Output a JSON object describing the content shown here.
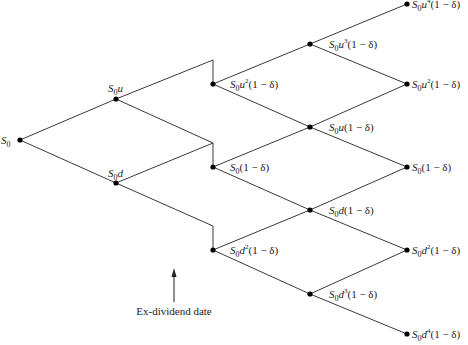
{
  "diagram": {
    "type": "binomial-tree",
    "title": "",
    "annotation": {
      "label": "Ex-dividend date",
      "arrow_direction": "up"
    },
    "symbols": {
      "initial": "S",
      "initial_sub": "0",
      "up": "u",
      "down": "d",
      "factor": "(1 − δ)"
    },
    "nodes": [
      {
        "id": "n0",
        "step": 0,
        "label": "S0"
      },
      {
        "id": "n1u",
        "step": 1,
        "label": "S0u"
      },
      {
        "id": "n1d",
        "step": 1,
        "label": "S0d"
      },
      {
        "id": "n2uu",
        "step": 2,
        "label": "S0u²(1 − δ)"
      },
      {
        "id": "n2ud",
        "step": 2,
        "label": "S0(1 − δ)"
      },
      {
        "id": "n2dd",
        "step": 2,
        "label": "S0d²(1 − δ)"
      },
      {
        "id": "n3u3",
        "step": 3,
        "label": "S0u³(1 − δ)"
      },
      {
        "id": "n3u1",
        "step": 3,
        "label": "S0u(1 − δ)"
      },
      {
        "id": "n3d1",
        "step": 3,
        "label": "S0d(1 − δ)"
      },
      {
        "id": "n3d3",
        "step": 3,
        "label": "S0d³(1 − δ)"
      },
      {
        "id": "n4u4",
        "step": 4,
        "label": "S0u⁴(1 − δ)"
      },
      {
        "id": "n4u2",
        "step": 4,
        "label": "S0u²(1 − δ)"
      },
      {
        "id": "n4c",
        "step": 4,
        "label": "S0(1 − δ)"
      },
      {
        "id": "n4d2",
        "step": 4,
        "label": "S0d²(1 − δ)"
      },
      {
        "id": "n4d4",
        "step": 4,
        "label": "S0d⁴(1 − δ)"
      }
    ],
    "labels": {
      "n0": {
        "base": "S",
        "sub": "0",
        "var": "",
        "sup": "",
        "tail": ""
      },
      "n1u": {
        "base": "S",
        "sub": "0",
        "var": "u",
        "sup": "",
        "tail": ""
      },
      "n1d": {
        "base": "S",
        "sub": "0",
        "var": "d",
        "sup": "",
        "tail": ""
      },
      "n2uu": {
        "base": "S",
        "sub": "0",
        "var": "u",
        "sup": "2",
        "tail": "(1 − δ)"
      },
      "n2ud": {
        "base": "S",
        "sub": "0",
        "var": "",
        "sup": "",
        "tail": "(1 − δ)"
      },
      "n2dd": {
        "base": "S",
        "sub": "0",
        "var": "d",
        "sup": "2",
        "tail": "(1 − δ)"
      },
      "n3u3": {
        "base": "S",
        "sub": "0",
        "var": "u",
        "sup": "3",
        "tail": "(1 − δ)"
      },
      "n3u1": {
        "base": "S",
        "sub": "0",
        "var": "u",
        "sup": "",
        "tail": "(1 − δ)"
      },
      "n3d1": {
        "base": "S",
        "sub": "0",
        "var": "d",
        "sup": "",
        "tail": "(1 − δ)"
      },
      "n3d3": {
        "base": "S",
        "sub": "0",
        "var": "d",
        "sup": "3",
        "tail": "(1 − δ)"
      },
      "n4u4": {
        "base": "S",
        "sub": "0",
        "var": "u",
        "sup": "4",
        "tail": "(1 − δ)"
      },
      "n4u2": {
        "base": "S",
        "sub": "0",
        "var": "u",
        "sup": "2",
        "tail": "(1 − δ)"
      },
      "n4c": {
        "base": "S",
        "sub": "0",
        "var": "",
        "sup": "",
        "tail": "(1 − δ)"
      },
      "n4d2": {
        "base": "S",
        "sub": "0",
        "var": "d",
        "sup": "2",
        "tail": "(1 − δ)"
      },
      "n4d4": {
        "base": "S",
        "sub": "0",
        "var": "d",
        "sup": "4",
        "tail": "(1 − δ)"
      }
    },
    "colors": {
      "line": "#3a3a3a",
      "node": "#000000",
      "text": "#222222",
      "background": "#ffffff"
    }
  }
}
